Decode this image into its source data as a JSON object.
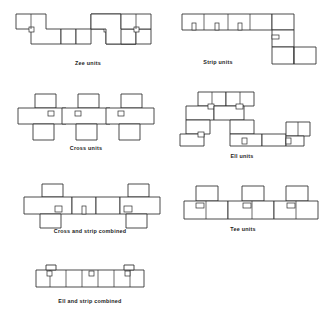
{
  "page": {
    "background_color": "#ffffff",
    "line_color": "#2b2b2b",
    "width": 332,
    "height": 326
  },
  "figures": [
    {
      "id": "zee-units",
      "caption": "Zee units",
      "caption_x": 88,
      "caption_y": 63,
      "origin_x": 16,
      "origin_y": 14,
      "module": 15,
      "description": "Row of Z-shaped units: a square offset up-left joined to a square offset down-right, repeated in a horizontal band.",
      "unit_count": 4,
      "shape": "zee"
    },
    {
      "id": "strip-units",
      "caption": "Strip units",
      "caption_x": 218,
      "caption_y": 62,
      "origin_x": 182,
      "origin_y": 14,
      "module": 15,
      "description": "Long horizontal strip of bays turning a right angle and descending, then stepping right again at the bottom.",
      "unit_count": 7,
      "shape": "strip"
    },
    {
      "id": "cross-units",
      "caption": "Cross units",
      "caption_x": 86,
      "caption_y": 148,
      "origin_x": 18,
      "origin_y": 94,
      "module": 15,
      "description": "Row of plus/cross-shaped units, each with a square projecting above and a square projecting below a central spine.",
      "unit_count": 3,
      "shape": "cross"
    },
    {
      "id": "ell-units",
      "caption": "Ell units",
      "caption_x": 242,
      "caption_y": 156,
      "origin_x": 186,
      "origin_y": 92,
      "module": 14,
      "description": "L-shaped units aggregated into a loose stepped cluster occupying an irregular footprint.",
      "unit_count": 8,
      "shape": "ell"
    },
    {
      "id": "cross-and-strip-combined",
      "caption": "Cross and strip combined",
      "caption_x": 90,
      "caption_y": 231,
      "origin_x": 24,
      "origin_y": 184,
      "module": 15,
      "description": "Two cross units at either end linked by a run of strip bays in the middle.",
      "unit_count": 5,
      "shape": "cross-strip"
    },
    {
      "id": "tee-units",
      "caption": "Tee units",
      "caption_x": 243,
      "caption_y": 229,
      "origin_x": 184,
      "origin_y": 186,
      "module": 15,
      "description": "Row of T-shaped units, each with a square projecting upward from a continuous lower band.",
      "unit_count": 3,
      "shape": "tee"
    },
    {
      "id": "ell-and-strip-combined",
      "caption": "Ell and strip combined",
      "caption_x": 90,
      "caption_y": 301,
      "origin_x": 36,
      "origin_y": 265,
      "module": 15,
      "description": "Single horizontal strip of bays with small ell returns at the left end, middle and right end.",
      "unit_count": 7,
      "shape": "ell-strip"
    }
  ]
}
